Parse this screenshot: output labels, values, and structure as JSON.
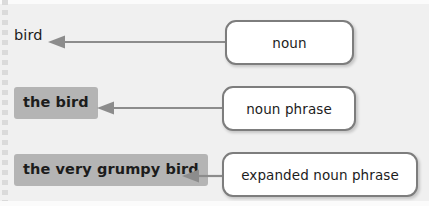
{
  "diagram": {
    "background_color": "#f0f0f0",
    "highlight_color": "#b4b4b4",
    "box_border_color": "#7d7d7d",
    "box_fill_color": "#ffffff",
    "arrow_color": "#8c8c8c",
    "text_color": "#1c1c1c"
  },
  "rows": [
    {
      "term": "bird",
      "term_style": "plain",
      "arrow": "left-arrow",
      "label": "noun"
    },
    {
      "term": "the bird",
      "term_style": "highlighted-bold",
      "arrow": "left-arrow",
      "label": "noun phrase"
    },
    {
      "term": "the very grumpy bird",
      "term_style": "highlighted-bold",
      "arrow": "left-arrow",
      "label": "expanded noun phrase"
    }
  ]
}
